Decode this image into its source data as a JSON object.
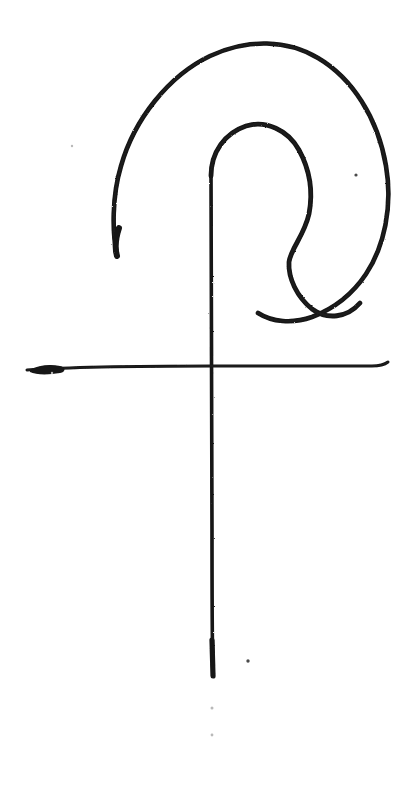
{
  "artwork": {
    "title": "Hand-drawn spiral hook glyph with crossbar",
    "medium": "ink on white paper",
    "background_color": "#ffffff",
    "ink_color": "#131313",
    "canvas": {
      "width": 407,
      "height": 790
    }
  },
  "strokes": [
    {
      "id": "outer-spiral",
      "name": "outer-spiral-stroke",
      "description": "Large open arc sweeping from lower-left tail up over the top and down the right side, curling inward at lower right",
      "stroke_width": 4.6,
      "path": "M 117 256 C 112 232 112 196 121 166 C 134 120 168 76 210 56 C 248 38 288 40 318 58 C 352 78 378 118 386 166 C 393 207 384 247 366 274 C 352 295 333 309 312 317 C 292 324 272 322 258 313"
    },
    {
      "id": "inner-hook",
      "name": "inner-hook-stroke",
      "description": "Inner hook: rises from the vertical stem, arches over to the right, bulges out, pinches in, then curls back left at the bottom",
      "stroke_width": 4.8,
      "path": "M 211 176 C 211 152 225 133 246 126 C 266 120 288 130 299 150 C 311 172 313 193 309 214 C 304 236 291 248 289 262 C 288 278 297 297 312 309 C 327 320 347 318 360 303"
    },
    {
      "id": "vertical-stem",
      "name": "vertical-stem-stroke",
      "description": "Long vertical line descending from the inner hook through the crossbar to near the bottom of the page",
      "stroke_width": 3.6,
      "path": "M 211 172 C 211 280 212 420 212 530 C 212 600 212 645 213 676"
    },
    {
      "id": "horizontal-crossbar",
      "name": "horizontal-crossbar-stroke",
      "description": "Horizontal line crossing the stem, thicker and darker at its left end, tapering with a small upward flick at the right end",
      "stroke_width": 3.0,
      "path": "M 27 370 C 70 367 140 366 212 366 C 280 366 340 366 372 366 C 379 366 384 365 388 362"
    }
  ],
  "marks": [
    {
      "id": "speck-right-of-spiral",
      "name": "ink-speck",
      "x": 356,
      "y": 175,
      "r": 1.6,
      "tone": "#4a4a4a"
    },
    {
      "id": "speck-below-stem",
      "name": "ink-speck",
      "x": 248,
      "y": 661,
      "r": 1.7,
      "tone": "#4a4a4a"
    },
    {
      "id": "faint-speck-lower-a",
      "name": "faint-paper-speck",
      "x": 212,
      "y": 708,
      "r": 1.5,
      "tone": "#b9b9b9"
    },
    {
      "id": "faint-speck-lower-b",
      "name": "faint-paper-speck",
      "x": 212,
      "y": 735,
      "r": 1.4,
      "tone": "#b9b9b9"
    },
    {
      "id": "faint-speck-left",
      "name": "faint-paper-speck",
      "x": 52,
      "y": 373,
      "r": 1.2,
      "tone": "#cccccc"
    },
    {
      "id": "faint-speck-upper-left",
      "name": "faint-paper-speck",
      "x": 72,
      "y": 146,
      "r": 1.2,
      "tone": "#d2d2d2"
    }
  ],
  "accents": {
    "crossbar_blob": {
      "name": "crossbar-left-ink-blob",
      "description": "Dense pooled ink at the left terminus of the horizontal line",
      "path": "M 30 370 C 38 365 50 364 60 366 C 66 367 66 372 60 373 C 48 375 36 375 30 372 Z"
    },
    "stem_base_thickening": {
      "name": "stem-base-thickening",
      "description": "Darker, slightly broader ink at the very bottom of the vertical stem",
      "path": "M 212 640 L 213 676",
      "stroke_width": 5.2
    },
    "spiral_tail_thickening": {
      "name": "outer-spiral-tail-thickening",
      "description": "Darker heavier ink at the free lower-left tail end of the outer spiral",
      "path": "M 119 228 C 115 240 115 249 117 256",
      "stroke_width": 6.0
    }
  }
}
